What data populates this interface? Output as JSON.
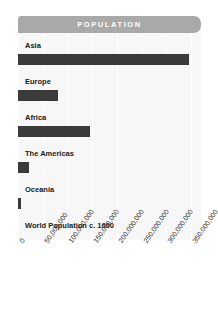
{
  "header": {
    "title": "POPULATION"
  },
  "colors": {
    "header_band": "#a9a9a9",
    "header_text": "#ffffff",
    "bar": "#3a3a3a",
    "plot_background": "#f7f7f7",
    "gridline": "#ffffff",
    "label_text": "#1a1a1a",
    "tick_text": "#333333"
  },
  "chart_data": {
    "type": "bar",
    "orientation": "horizontal",
    "title": "POPULATION",
    "xlabel": "",
    "ylabel": "",
    "categories": [
      "Asia",
      "Europe",
      "Africa",
      "The Americas",
      "Oceania",
      "World Population c. 1600"
    ],
    "values": [
      345000000,
      80000000,
      145000000,
      22000000,
      6000000,
      0
    ],
    "xlim": [
      0,
      370000000
    ],
    "tick_values": [
      0,
      50000000,
      100000000,
      150000000,
      200000000,
      250000000,
      300000000,
      350000000
    ],
    "tick_labels": [
      "0",
      "50,000,000",
      "100,000,000",
      "150,000,000",
      "200,000,000",
      "250,000,000",
      "300,000,000",
      "350,000,000"
    ],
    "grid": true,
    "grid_axis": "x",
    "legend": false,
    "series": [
      {
        "name": "Population",
        "values": [
          345000000,
          80000000,
          145000000,
          22000000,
          6000000,
          0
        ]
      }
    ]
  }
}
